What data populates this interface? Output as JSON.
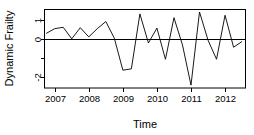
{
  "chart_data": {
    "type": "line",
    "title": "",
    "subtitle": "",
    "xlabel": "Time",
    "ylabel": "Dynamic Frailty",
    "xlim": [
      2006.7,
      2012.6
    ],
    "ylim": [
      -2.55,
      1.55
    ],
    "grid": false,
    "legend": null,
    "xticks": [
      2007,
      2008,
      2009,
      2010,
      2011,
      2012
    ],
    "xtick_labels": [
      "2007",
      "2008",
      "2009",
      "2010",
      "2011",
      "2012"
    ],
    "yticks": [
      1,
      0,
      -1,
      -2
    ],
    "ytick_labels": [
      "1",
      "0",
      "",
      "-2"
    ],
    "reference_line": {
      "y": 0,
      "style": "solid",
      "color": "#000000"
    },
    "line_color": "#000000",
    "series": [
      {
        "name": "Dynamic Frailty",
        "x": [
          2006.75,
          2007.0,
          2007.25,
          2007.5,
          2007.75,
          2008.0,
          2008.25,
          2008.5,
          2008.75,
          2009.0,
          2009.25,
          2009.5,
          2009.75,
          2010.0,
          2010.25,
          2010.5,
          2010.75,
          2011.0,
          2011.25,
          2011.5,
          2011.75,
          2012.0,
          2012.25,
          2012.5
        ],
        "values": [
          0.3,
          0.55,
          0.62,
          0.02,
          0.6,
          0.12,
          0.55,
          0.92,
          0.05,
          -1.62,
          -1.55,
          1.32,
          -0.2,
          0.58,
          -1.05,
          1.12,
          -0.3,
          -2.4,
          1.42,
          -0.05,
          -1.05,
          1.25,
          -0.42,
          -0.12
        ]
      }
    ]
  },
  "axes": {
    "y_label": "Dynamic Frailty",
    "x_label": "Time"
  }
}
